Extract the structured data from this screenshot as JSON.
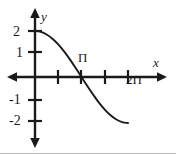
{
  "figure": {
    "background_color": "#ffffff",
    "ink_color": "#1a1a1a",
    "width": 176,
    "height": 154
  },
  "axes": {
    "x_axis_label": "x",
    "y_axis_label": "y",
    "x_tick_labels": [
      "Π",
      "2Π"
    ],
    "y_tick_labels": [
      "2",
      "1",
      "-1",
      "-2"
    ]
  },
  "chart_data": {
    "type": "line",
    "title": "",
    "xlabel": "x",
    "ylabel": "y",
    "xlim": [
      -1.0,
      7.6
    ],
    "ylim": [
      -2.8,
      2.8
    ],
    "grid": false,
    "legend": null,
    "x_ticks": [
      1.5708,
      3.1416,
      4.7124,
      6.2832
    ],
    "x_tick_labels": [
      "",
      "Π",
      "",
      "2Π"
    ],
    "y_ticks": [
      2,
      1,
      -1,
      -2
    ],
    "y_tick_labels": [
      "2",
      "1",
      "-1",
      "-2"
    ],
    "series": [
      {
        "name": "y = 2cos(x/2)",
        "color": "#1a1a1a",
        "x": [
          0.0,
          0.3927,
          0.7854,
          1.1781,
          1.5708,
          1.9635,
          2.3562,
          2.7489,
          3.1416,
          3.5343,
          3.927,
          4.3197,
          4.7124,
          5.1051,
          5.4978,
          5.8905,
          6.2832
        ],
        "values": [
          2.0,
          1.9616,
          1.8478,
          1.6629,
          1.4142,
          1.1111,
          0.7654,
          0.3902,
          0.0,
          -0.3902,
          -0.7654,
          -1.1111,
          -1.4142,
          -1.6629,
          -1.8478,
          -1.9616,
          -2.0
        ]
      }
    ],
    "annotations": [
      {
        "text": "Π",
        "x": 3.1416,
        "y": 0.55,
        "note": "x-intercept label above axis"
      },
      {
        "text": "2Π",
        "x": 6.2832,
        "y": -0.55,
        "note": "label below axis at curve minimum"
      }
    ]
  }
}
